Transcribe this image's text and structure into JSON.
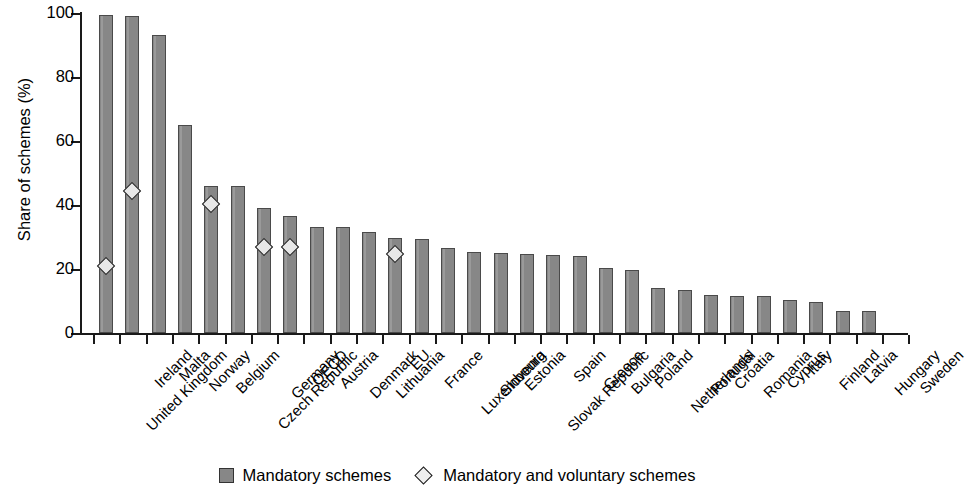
{
  "chart_data": {
    "type": "bar",
    "title": "",
    "xlabel": "",
    "ylabel": "Share of schemes (%)",
    "ylim": [
      0,
      100
    ],
    "ytick_labels": [
      "0",
      "20",
      "40",
      "60",
      "80",
      "100"
    ],
    "ytick_values": [
      0,
      20,
      40,
      60,
      80,
      100
    ],
    "grid": false,
    "legend_position": "bottom-center",
    "categories": [
      "United Kingdom",
      "Ireland",
      "Malta",
      "Norway",
      "Belgium",
      "Czech Republic",
      "Germany",
      "OECD",
      "Austria",
      "Denmark",
      "Lithuania",
      "EU",
      "France",
      "Luxembourg",
      "Slovenia",
      "Estonia",
      "Slovak Republic",
      "Spain",
      "Greece",
      "Bulgaria",
      "Poland",
      "Netherlands",
      "Portugal",
      "Croatia",
      "Romania",
      "Cyprus",
      "Italy",
      "Finland",
      "Latvia",
      "Hungary",
      "Sweden"
    ],
    "series": [
      {
        "name": "Mandatory schemes",
        "type": "bar",
        "color": "#878787",
        "values": [
          99.5,
          99.0,
          93.0,
          65.0,
          46.0,
          46.0,
          39.0,
          36.5,
          33.0,
          33.0,
          31.5,
          29.8,
          29.5,
          26.5,
          25.3,
          24.9,
          24.8,
          24.5,
          24.1,
          20.4,
          19.8,
          14.0,
          13.5,
          11.8,
          11.6,
          11.5,
          10.4,
          9.6,
          7.0,
          6.8,
          0
        ]
      },
      {
        "name": "Mandatory and voluntary schemes",
        "type": "scatter",
        "marker": "diamond",
        "color": "#eeeeee",
        "points": [
          {
            "category": "United Kingdom",
            "value": 23.0
          },
          {
            "category": "Ireland",
            "value": 46.5
          },
          {
            "category": "Belgium",
            "value": 42.5
          },
          {
            "category": "Germany",
            "value": 28.8
          },
          {
            "category": "OECD",
            "value": 29.0
          },
          {
            "category": "EU",
            "value": 26.8
          }
        ]
      }
    ]
  },
  "legend": {
    "items": [
      {
        "label": "Mandatory schemes",
        "marker": "square"
      },
      {
        "label": "Mandatory and voluntary schemes",
        "marker": "diamond"
      }
    ]
  }
}
